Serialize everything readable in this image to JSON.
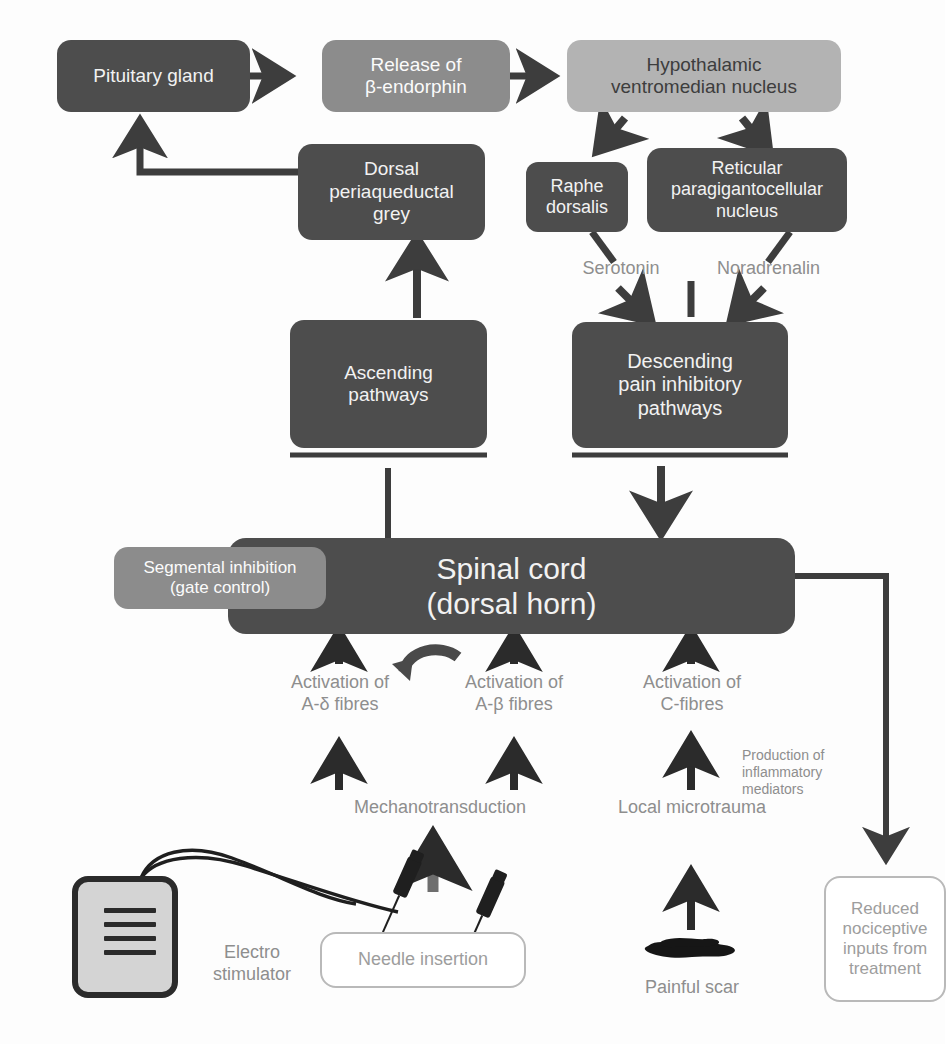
{
  "diagram": {
    "boxes": {
      "pituitary_gland": "Pituitary gland",
      "release_beta_endorphin": "Release of\nβ-endorphin",
      "hypothalamic_nucleus": "Hypothalamic\nventromedian nucleus",
      "dorsal_periaqueductal_grey": "Dorsal\nperiaqueductal\ngrey",
      "raphe_dorsalis": "Raphe\ndorsalis",
      "reticular_nucleus": "Reticular\nparagigantocellular\nnucleus",
      "ascending_pathways": "Ascending\npathways",
      "descending_pathways": "Descending\npain inhibitory\npathways",
      "spinal_cord": "Spinal cord\n(dorsal horn)",
      "segmental_inhibition": "Segmental inhibition\n(gate control)",
      "needle_insertion": "Needle insertion",
      "reduced_nociceptive": "Reduced\nnociceptive\ninputs from\ntreatment"
    },
    "labels": {
      "serotonin": "Serotonin",
      "noradrenalin": "Noradrenalin",
      "activation_a_delta": "Activation of\nA-δ fibres",
      "activation_a_beta": "Activation of\nA-β fibres",
      "activation_c": "Activation of\nC-fibres",
      "mechanotransduction": "Mechanotransduction",
      "local_microtrauma": "Local microtrauma",
      "inflammatory_mediators": "Production of\ninflammatory\nmediators",
      "electro_stimulator": "Electro\nstimulator",
      "painful_scar": "Painful scar"
    },
    "colors": {
      "box_dark": "#4d4d4d",
      "box_mid": "#8c8c8c",
      "box_light": "#b3b3b3",
      "outline_gray": "#b9b9b9",
      "label_gray": "#8e8e8e",
      "arrow_dark": "#3d3d3d",
      "ink_black": "#2b2b2b",
      "stimulator_fill": "#d4d4d4",
      "background": "#fdfdfd"
    }
  }
}
